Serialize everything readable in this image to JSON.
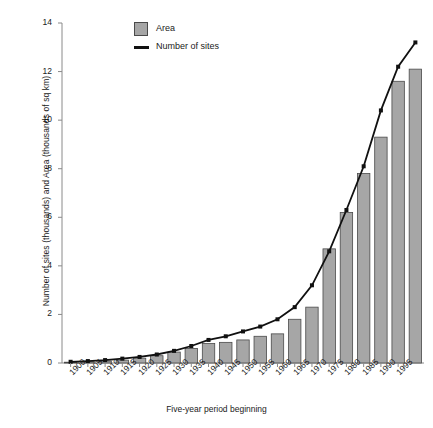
{
  "chart_data": {
    "type": "bar",
    "title": "",
    "xlabel": "Five-year period beginning",
    "ylabel": "Number of sites (thousands) and Area (thousands of sq km)",
    "categories": [
      "1900",
      "1905",
      "1910",
      "1915",
      "1920",
      "1925",
      "1930",
      "1935",
      "1940",
      "1945",
      "1950",
      "1955",
      "1960",
      "1965",
      "1970",
      "1975",
      "1980",
      "1985",
      "1990",
      "1995"
    ],
    "ylim": [
      0,
      14
    ],
    "yticks": [
      0,
      2,
      4,
      6,
      8,
      10,
      12,
      14
    ],
    "grid": false,
    "legend_position": "top-left-inside",
    "series": [
      {
        "name": "Area",
        "type": "bar",
        "color": "#a6a6a6",
        "edge_color": "#4a4a4a",
        "values": [
          0.03,
          0.05,
          0.08,
          0.12,
          0.2,
          0.3,
          0.45,
          0.6,
          0.8,
          0.85,
          0.95,
          1.1,
          1.2,
          1.8,
          2.3,
          4.7,
          6.2,
          7.8,
          9.3,
          11.6
        ]
      },
      {
        "name": "Number of sites",
        "type": "line",
        "color": "#111111",
        "marker": "square",
        "values": [
          0.05,
          0.08,
          0.12,
          0.18,
          0.25,
          0.35,
          0.5,
          0.7,
          0.95,
          1.1,
          1.3,
          1.5,
          1.8,
          2.3,
          3.2,
          4.6,
          6.3,
          8.1,
          10.4,
          12.2
        ]
      }
    ],
    "extra_bar": {
      "note": "final bar at far right",
      "value": 12.1
    },
    "extra_line_point": {
      "note": "line terminal point at far right",
      "value": 13.2
    }
  },
  "legend": {
    "items": [
      {
        "label": "Area",
        "glyph": "swatch-icon"
      },
      {
        "label": "Number of sites",
        "glyph": "line-icon"
      }
    ]
  },
  "axes": {
    "y_label_text": "Number of sites (thousands) and Area (thousands of sq km)",
    "x_label_text": "Five-year period beginning"
  }
}
